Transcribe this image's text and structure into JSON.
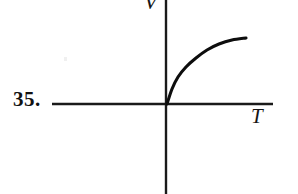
{
  "figure": {
    "problem_number": "35.",
    "background_color": "#ffffff",
    "ink_color": "#111111",
    "axis_color": "#1a1a1a",
    "curve_color": "#0d0d0d"
  },
  "axes": {
    "y_label": "V",
    "x_label": "T",
    "y_label_name": "volume-axis-label",
    "x_label_name": "time-axis-label",
    "origin": {
      "x": 166,
      "y": 104
    },
    "horizontal": {
      "x1": 52,
      "y1": 104,
      "x2": 273,
      "y2": 104
    },
    "vertical": {
      "x1": 166,
      "y1": 0,
      "x2": 166,
      "y2": 194
    }
  },
  "chart_data": {
    "type": "line",
    "title": "",
    "xlabel": "T",
    "ylabel": "V",
    "grid": false,
    "legend": false,
    "xlim": [
      0,
      110
    ],
    "ylim": [
      0,
      110
    ],
    "series": [
      {
        "name": "V(T)",
        "x": [
          0,
          4,
          9,
          15,
          22,
          30,
          40,
          50,
          62,
          75,
          88,
          100
        ],
        "y": [
          0,
          22,
          39,
          52,
          62,
          70,
          77,
          82,
          86,
          88,
          89,
          90
        ]
      }
    ],
    "path_points_px": [
      {
        "x": 167,
        "y": 104
      },
      {
        "x": 172,
        "y": 89
      },
      {
        "x": 178,
        "y": 77
      },
      {
        "x": 186,
        "y": 67
      },
      {
        "x": 196,
        "y": 58
      },
      {
        "x": 207,
        "y": 50
      },
      {
        "x": 219,
        "y": 44
      },
      {
        "x": 232,
        "y": 40
      },
      {
        "x": 246,
        "y": 38
      }
    ]
  }
}
